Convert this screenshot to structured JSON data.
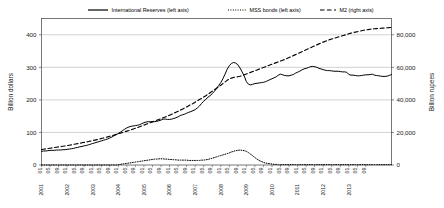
{
  "chart_data": {
    "type": "line",
    "title": "",
    "xlabel": "",
    "ylabel": "Billion dollars",
    "y2label": "Billion rupees",
    "grid": true,
    "legend_position": "top",
    "ylim": [
      0,
      450
    ],
    "y2lim": [
      0,
      90000
    ],
    "yticks": [
      "0",
      "100",
      "200",
      "300",
      "400"
    ],
    "ytick_values": [
      0,
      100,
      200,
      300,
      400
    ],
    "y2ticks": [
      "0",
      "20,000",
      "40,000",
      "60,000",
      "80,000"
    ],
    "y2tick_values": [
      0,
      20000,
      40000,
      60000,
      80000
    ],
    "x_start": "2001 01",
    "x_end": "2013 09",
    "xticks": [
      {
        "year": "2001",
        "month": "01"
      },
      {
        "year": "",
        "month": "05"
      },
      {
        "year": "",
        "month": "09"
      },
      {
        "year": "2002",
        "month": "01"
      },
      {
        "year": "",
        "month": "05"
      },
      {
        "year": "",
        "month": "09"
      },
      {
        "year": "2003",
        "month": "01"
      },
      {
        "year": "",
        "month": "05"
      },
      {
        "year": "",
        "month": "09"
      },
      {
        "year": "2004",
        "month": "01"
      },
      {
        "year": "",
        "month": "05"
      },
      {
        "year": "",
        "month": "09"
      },
      {
        "year": "2005",
        "month": "01"
      },
      {
        "year": "",
        "month": "05"
      },
      {
        "year": "",
        "month": "09"
      },
      {
        "year": "2006",
        "month": "01"
      },
      {
        "year": "",
        "month": "05"
      },
      {
        "year": "",
        "month": "09"
      },
      {
        "year": "2007",
        "month": "01"
      },
      {
        "year": "",
        "month": "05"
      },
      {
        "year": "",
        "month": "09"
      },
      {
        "year": "2008",
        "month": "01"
      },
      {
        "year": "",
        "month": "05"
      },
      {
        "year": "",
        "month": "09"
      },
      {
        "year": "2009",
        "month": "01"
      },
      {
        "year": "",
        "month": "05"
      },
      {
        "year": "",
        "month": "09"
      },
      {
        "year": "2010",
        "month": "01"
      },
      {
        "year": "",
        "month": "05"
      },
      {
        "year": "",
        "month": "09"
      },
      {
        "year": "2011",
        "month": "01"
      },
      {
        "year": "",
        "month": "05"
      },
      {
        "year": "",
        "month": "09"
      },
      {
        "year": "2012",
        "month": "01"
      },
      {
        "year": "",
        "month": "05"
      },
      {
        "year": "",
        "month": "09"
      },
      {
        "year": "2013",
        "month": "01"
      },
      {
        "year": "",
        "month": "05"
      },
      {
        "year": "",
        "month": "09"
      }
    ],
    "series": [
      {
        "name": "International Reserves (left axis)",
        "axis": "left",
        "style": "solid",
        "color": "#000000",
        "values": [
          42,
          43,
          43,
          44,
          45,
          45,
          45,
          46,
          46,
          46,
          47,
          47,
          48,
          49,
          50,
          51,
          53,
          54,
          56,
          57,
          59,
          60,
          62,
          64,
          66,
          68,
          70,
          72,
          74,
          76,
          78,
          80,
          83,
          86,
          90,
          93,
          97,
          101,
          106,
          110,
          114,
          117,
          119,
          120,
          121,
          122,
          124,
          127,
          130,
          132,
          133,
          133,
          133,
          133,
          134,
          136,
          138,
          141,
          141,
          140,
          140,
          141,
          143,
          145,
          148,
          152,
          154,
          156,
          159,
          162,
          164,
          167,
          170,
          175,
          181,
          189,
          196,
          202,
          208,
          213,
          219,
          226,
          235,
          244,
          253,
          265,
          279,
          294,
          305,
          312,
          315,
          313,
          308,
          298,
          286,
          273,
          256,
          248,
          246,
          248,
          250,
          251,
          252,
          253,
          254,
          256,
          259,
          262,
          265,
          268,
          271,
          276,
          279,
          277,
          275,
          274,
          274,
          276,
          278,
          282,
          285,
          288,
          292,
          295,
          297,
          299,
          302,
          303,
          302,
          300,
          297,
          295,
          293,
          291,
          290,
          290,
          289,
          288,
          288,
          288,
          287,
          286,
          286,
          285,
          278,
          276,
          276,
          275,
          274,
          274,
          275,
          276,
          277,
          277,
          278,
          279,
          276,
          275,
          274,
          273,
          272,
          272,
          273,
          275,
          278
        ]
      },
      {
        "name": "MSS bonds (left axis)",
        "axis": "left",
        "style": "dotted",
        "color": "#000000",
        "values": [
          0,
          0,
          0,
          0,
          0,
          0,
          0,
          0,
          0,
          0,
          0,
          0,
          0,
          0,
          0,
          0,
          0,
          0,
          0,
          0,
          0,
          0,
          0,
          0,
          0,
          0,
          0,
          0,
          0,
          0,
          0,
          0,
          0,
          0,
          0,
          0,
          1,
          2,
          3,
          4,
          5,
          6,
          7,
          8,
          9,
          10,
          11,
          12,
          13,
          14,
          15,
          16,
          17,
          18,
          18,
          19,
          19,
          19,
          18,
          18,
          17,
          17,
          16,
          16,
          15,
          15,
          15,
          15,
          15,
          14,
          14,
          14,
          14,
          14,
          14,
          15,
          15,
          16,
          17,
          19,
          21,
          23,
          25,
          27,
          29,
          31,
          33,
          35,
          37,
          40,
          42,
          44,
          45,
          46,
          45,
          44,
          42,
          38,
          33,
          28,
          23,
          18,
          14,
          11,
          8,
          6,
          5,
          4,
          3,
          2,
          2,
          1,
          1,
          1,
          1,
          1,
          1,
          1,
          1,
          1,
          1,
          1,
          1,
          1,
          1,
          1,
          1,
          1,
          1,
          1,
          1,
          1,
          1,
          1,
          1,
          1,
          1,
          1,
          1,
          1,
          1,
          1,
          1,
          1,
          1,
          1,
          1,
          1,
          1,
          1,
          1,
          1,
          1,
          1,
          1,
          1,
          1,
          1,
          1,
          1,
          1,
          1,
          1,
          1,
          1
        ]
      },
      {
        "name": "M2 (right axis)",
        "axis": "right",
        "style": "dashed",
        "color": "#000000",
        "values": [
          9500,
          9700,
          9900,
          10100,
          10300,
          10500,
          10700,
          10900,
          11100,
          11300,
          11500,
          11700,
          11900,
          12150,
          12400,
          12650,
          12900,
          13150,
          13400,
          13650,
          13900,
          14150,
          14400,
          14700,
          15000,
          15300,
          15600,
          15900,
          16250,
          16600,
          16950,
          17300,
          17650,
          18000,
          18400,
          18800,
          19200,
          19600,
          20000,
          20400,
          20800,
          21200,
          21650,
          22100,
          22550,
          23000,
          23500,
          24000,
          24500,
          25000,
          25500,
          26000,
          26500,
          27000,
          27500,
          28000,
          28500,
          29000,
          29500,
          30000,
          30600,
          31200,
          31800,
          32400,
          33000,
          33600,
          34300,
          35000,
          35700,
          36400,
          37100,
          37800,
          38600,
          39400,
          40200,
          41000,
          41800,
          42600,
          43500,
          44400,
          45300,
          46200,
          47100,
          48000,
          49000,
          50000,
          51000,
          52000,
          52800,
          53400,
          53800,
          54000,
          54200,
          54500,
          54900,
          55400,
          55900,
          56400,
          56900,
          57400,
          57900,
          58400,
          58900,
          59400,
          59900,
          60400,
          60900,
          61400,
          61900,
          62400,
          62900,
          63400,
          63900,
          64400,
          64900,
          65400,
          66000,
          66600,
          67200,
          67800,
          68400,
          69000,
          69600,
          70200,
          70800,
          71400,
          72000,
          72600,
          73200,
          73800,
          74400,
          75000,
          75500,
          76000,
          76500,
          77000,
          77400,
          77800,
          78200,
          78600,
          79000,
          79400,
          79800,
          80200,
          80600,
          81000,
          81300,
          81600,
          81900,
          82200,
          82500,
          82800,
          83000,
          83200,
          83400,
          83600,
          83700,
          83800,
          83900,
          84000,
          84100,
          84200,
          84300,
          84400,
          84500
        ]
      }
    ]
  }
}
